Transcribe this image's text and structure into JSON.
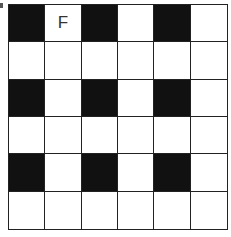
{
  "puzzle": {
    "rows": 6,
    "cols": 6,
    "colors": {
      "black": "#111111",
      "white": "#ffffff",
      "line": "#222222"
    },
    "cells": [
      [
        {
          "fill": "black",
          "letter": ""
        },
        {
          "fill": "white",
          "letter": "F"
        },
        {
          "fill": "black",
          "letter": ""
        },
        {
          "fill": "white",
          "letter": ""
        },
        {
          "fill": "black",
          "letter": ""
        },
        {
          "fill": "white",
          "letter": ""
        }
      ],
      [
        {
          "fill": "white",
          "letter": ""
        },
        {
          "fill": "white",
          "letter": ""
        },
        {
          "fill": "white",
          "letter": ""
        },
        {
          "fill": "white",
          "letter": ""
        },
        {
          "fill": "white",
          "letter": ""
        },
        {
          "fill": "white",
          "letter": ""
        }
      ],
      [
        {
          "fill": "black",
          "letter": ""
        },
        {
          "fill": "white",
          "letter": ""
        },
        {
          "fill": "black",
          "letter": ""
        },
        {
          "fill": "white",
          "letter": ""
        },
        {
          "fill": "black",
          "letter": ""
        },
        {
          "fill": "white",
          "letter": ""
        }
      ],
      [
        {
          "fill": "white",
          "letter": ""
        },
        {
          "fill": "white",
          "letter": ""
        },
        {
          "fill": "white",
          "letter": ""
        },
        {
          "fill": "white",
          "letter": ""
        },
        {
          "fill": "white",
          "letter": ""
        },
        {
          "fill": "white",
          "letter": ""
        }
      ],
      [
        {
          "fill": "black",
          "letter": ""
        },
        {
          "fill": "white",
          "letter": ""
        },
        {
          "fill": "black",
          "letter": ""
        },
        {
          "fill": "white",
          "letter": ""
        },
        {
          "fill": "black",
          "letter": ""
        },
        {
          "fill": "white",
          "letter": ""
        }
      ],
      [
        {
          "fill": "white",
          "letter": ""
        },
        {
          "fill": "white",
          "letter": ""
        },
        {
          "fill": "white",
          "letter": ""
        },
        {
          "fill": "white",
          "letter": ""
        },
        {
          "fill": "white",
          "letter": ""
        },
        {
          "fill": "white",
          "letter": ""
        }
      ]
    ]
  }
}
